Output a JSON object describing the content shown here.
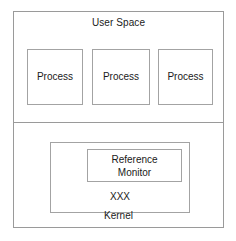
{
  "diagram": {
    "regions": {
      "user_space": {
        "label": "User Space",
        "processes": [
          {
            "label": "Process"
          },
          {
            "label": "Process"
          },
          {
            "label": "Process"
          }
        ]
      },
      "kernel": {
        "label": "Kernel",
        "module": {
          "label": "XXX",
          "reference_monitor": {
            "line1": "Reference",
            "line2": "Monitor"
          }
        }
      }
    }
  },
  "colors": {
    "background": "#ffffff",
    "border": "#9a9a9a",
    "inner_border": "#a3a3a3",
    "text": "#1a1a1a"
  }
}
